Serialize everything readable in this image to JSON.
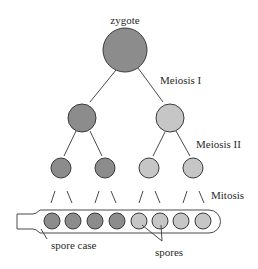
{
  "diagram": {
    "labels": {
      "zygote": "zygote",
      "meiosis1": "Meiosis I",
      "meiosis2": "Meiosis II",
      "mitosis": "Mitosis",
      "spore_case": "spore case",
      "spores": "spores"
    },
    "colors": {
      "dark": "#8c8c8c",
      "light": "#c6c6c6",
      "stroke": "#3a3a3a"
    },
    "nodes": {
      "zygote": {
        "cx": 125,
        "cy": 50,
        "r": 22,
        "shade": "dark"
      },
      "level2": [
        {
          "cx": 82,
          "cy": 118,
          "r": 14,
          "shade": "dark"
        },
        {
          "cx": 170,
          "cy": 118,
          "r": 14,
          "shade": "light"
        }
      ],
      "level3": [
        {
          "cx": 61,
          "cy": 168,
          "r": 10,
          "shade": "dark"
        },
        {
          "cx": 105,
          "cy": 168,
          "r": 10,
          "shade": "dark"
        },
        {
          "cx": 149,
          "cy": 168,
          "r": 10,
          "shade": "light"
        },
        {
          "cx": 193,
          "cy": 168,
          "r": 10,
          "shade": "light"
        }
      ],
      "spores": [
        {
          "cx": 52,
          "cy": 221,
          "r": 8,
          "shade": "dark"
        },
        {
          "cx": 73,
          "cy": 221,
          "r": 8,
          "shade": "dark"
        },
        {
          "cx": 95,
          "cy": 221,
          "r": 8,
          "shade": "dark"
        },
        {
          "cx": 117,
          "cy": 221,
          "r": 8,
          "shade": "dark"
        },
        {
          "cx": 139,
          "cy": 221,
          "r": 8,
          "shade": "light"
        },
        {
          "cx": 160,
          "cy": 221,
          "r": 8,
          "shade": "light"
        },
        {
          "cx": 181,
          "cy": 221,
          "r": 8,
          "shade": "light"
        },
        {
          "cx": 203,
          "cy": 221,
          "r": 8,
          "shade": "light"
        }
      ]
    }
  }
}
